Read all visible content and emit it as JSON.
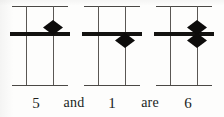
{
  "figure": {
    "kind": "abacus-bead-diagram",
    "background_color": "#fdfdfc",
    "ink_color": "#131210",
    "rail_color": "#4a4845",
    "columns": [
      {
        "id": "column-1",
        "name": "first-abacus",
        "value_label": "5",
        "beads": [
          {
            "position": "above-beam",
            "shape": "diamond",
            "rod": "right"
          }
        ]
      },
      {
        "id": "column-2",
        "name": "second-abacus",
        "value_label": "1",
        "beads": [
          {
            "position": "below-beam",
            "shape": "diamond",
            "rod": "right"
          }
        ]
      },
      {
        "id": "column-3",
        "name": "third-abacus",
        "value_label": "6",
        "beads": [
          {
            "position": "above-beam",
            "shape": "diamond",
            "rod": "right"
          },
          {
            "position": "below-beam",
            "shape": "diamond",
            "rod": "right"
          }
        ]
      }
    ]
  },
  "caption": {
    "full_text": "5 and 1 are 6",
    "tokens": [
      {
        "text": "5",
        "type": "number"
      },
      {
        "text": "and",
        "type": "word"
      },
      {
        "text": "1",
        "type": "number"
      },
      {
        "text": "are",
        "type": "word"
      },
      {
        "text": "6",
        "type": "number"
      }
    ]
  }
}
